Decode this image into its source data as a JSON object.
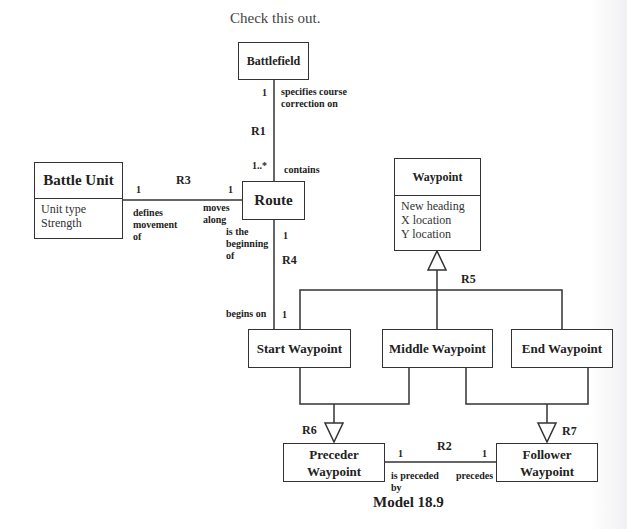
{
  "caption_top": "Check this out.",
  "model_caption": "Model 18.9",
  "classes": {
    "battlefield": {
      "name": "Battlefield"
    },
    "battle_unit": {
      "name": "Battle Unit",
      "attributes": [
        "Unit type",
        "Strength"
      ]
    },
    "route": {
      "name": "Route"
    },
    "waypoint": {
      "name": "Waypoint",
      "attributes": [
        "New heading",
        "X location",
        "Y location"
      ]
    },
    "start_waypoint": {
      "name": "Start Waypoint"
    },
    "middle_waypoint": {
      "name": "Middle Waypoint"
    },
    "end_waypoint": {
      "name": "End Waypoint"
    },
    "preceder_waypoint": {
      "name_line1": "Preceder",
      "name_line2": "Waypoint"
    },
    "follower_waypoint": {
      "name_line1": "Follower",
      "name_line2": "Waypoint"
    }
  },
  "relationships": {
    "r1": {
      "id": "R1",
      "mult_top": "1",
      "mult_bottom": "1..*",
      "phrase_top_line1": "specifies course",
      "phrase_top_line2": "correction on",
      "phrase_bottom": "contains"
    },
    "r2": {
      "id": "R2",
      "mult_left": "1",
      "mult_right": "1",
      "phrase_left_line1": "is preceded",
      "phrase_left_line2": "by",
      "phrase_right": "precedes"
    },
    "r3": {
      "id": "R3",
      "mult_left": "1",
      "mult_right": "1",
      "phrase_left_line1": "defines",
      "phrase_left_line2": "movement",
      "phrase_left_line3": "of",
      "phrase_right_line1": "moves",
      "phrase_right_line2": "along"
    },
    "r4": {
      "id": "R4",
      "mult_top": "1",
      "mult_bottom": "1",
      "phrase_top_line1": "is the",
      "phrase_top_line2": "beginning",
      "phrase_top_line3": "of",
      "phrase_bottom": "begins on"
    },
    "r5": {
      "id": "R5"
    },
    "r6": {
      "id": "R6"
    },
    "r7": {
      "id": "R7"
    }
  }
}
